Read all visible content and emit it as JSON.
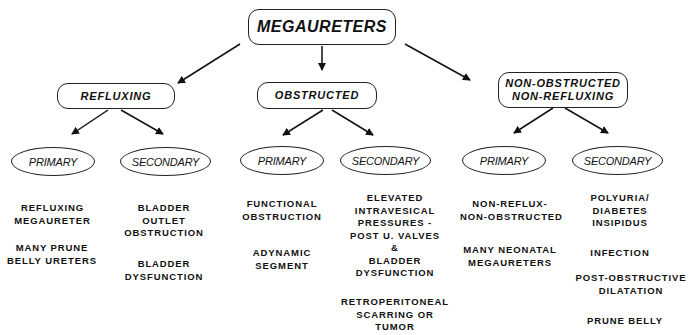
{
  "title": "MEGAURETERS",
  "categories": [
    {
      "label": "REFLUXING",
      "primary": {
        "label": "PRIMARY",
        "items": [
          "REFLUXING\nMEGAURETER",
          "MANY PRUNE\nBELLY URETERS"
        ]
      },
      "secondary": {
        "label": "SECONDARY",
        "items": [
          "BLADDER\nOUTLET\nOBSTRUCTION",
          "BLADDER\nDYSFUNCTION"
        ]
      }
    },
    {
      "label": "OBSTRUCTED",
      "primary": {
        "label": "PRIMARY",
        "items": [
          "FUNCTIONAL\nOBSTRUCTION",
          "ADYNAMIC\nSEGMENT"
        ]
      },
      "secondary": {
        "label": "SECONDARY",
        "items": [
          "ELEVATED\nINTRAVESICAL\nPRESSURES -\nPOST U. VALVES\n&\nBLADDER\nDYSFUNCTION",
          "RETROPERITONEAL\nSCARRING OR\nTUMOR"
        ]
      }
    },
    {
      "label": "NON-OBSTRUCTED\nNON-REFLUXING",
      "primary": {
        "label": "PRIMARY",
        "items": [
          "NON-REFLUX-\nNON-OBSTRUCTED",
          "MANY NEONATAL\nMEGAURETERS"
        ]
      },
      "secondary": {
        "label": "SECONDARY",
        "items": [
          "POLYURIA/\nDIABETES\nINSIPIDUS",
          "INFECTION",
          "POST-OBSTRUCTIVE\nDILATATION",
          "PRUNE BELLY"
        ]
      }
    }
  ]
}
